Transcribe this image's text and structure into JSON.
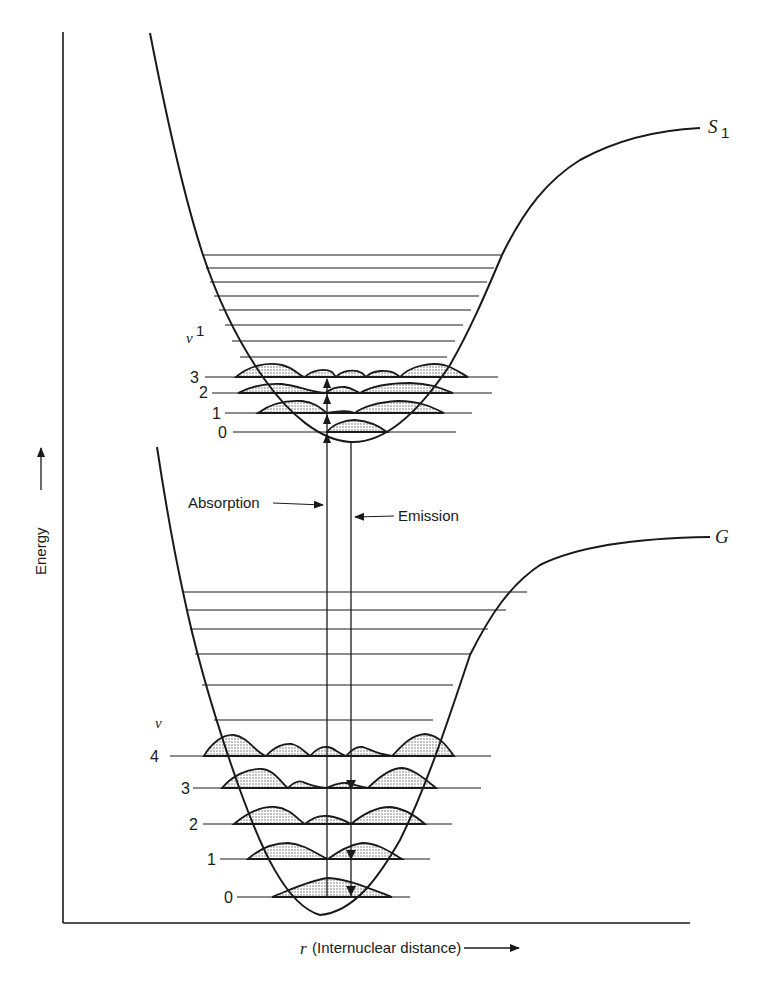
{
  "figure": {
    "axes": {
      "y_label": "Energy",
      "x_label_symbol": "r",
      "x_label_text": "(Internuclear distance)"
    },
    "states": {
      "excited": {
        "label": "S",
        "subscript": "1",
        "quantum_label": "ν",
        "quantum_superscript": "1",
        "levels": [
          "0",
          "1",
          "2",
          "3"
        ]
      },
      "ground": {
        "label": "G",
        "quantum_label": "ν",
        "levels": [
          "0",
          "1",
          "2",
          "3",
          "4"
        ]
      }
    },
    "transitions": {
      "absorption": "Absorption",
      "emission": "Emission"
    }
  }
}
